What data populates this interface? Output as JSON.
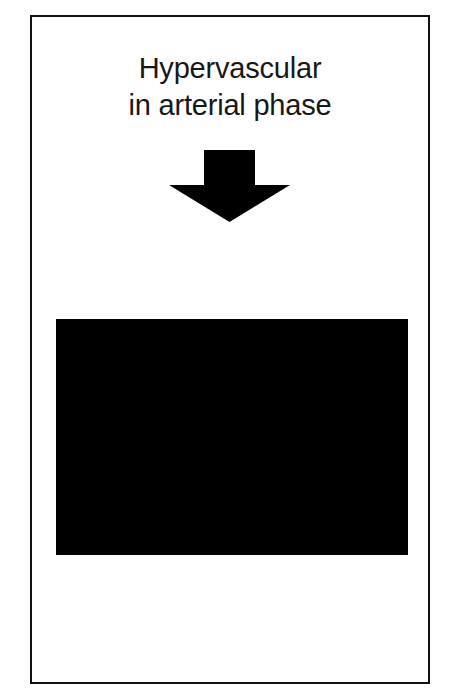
{
  "slide": {
    "background_color": "#ffffff",
    "border_color": "#111111",
    "caption": {
      "line1": "Hypervascular",
      "line2": "in arterial phase",
      "color": "#171717"
    },
    "arrow": {
      "icon": "arrow-down-block-icon",
      "direction": "down",
      "color": "#000000"
    },
    "figure": {
      "modality": "CT",
      "plane": "axial",
      "region": "upper abdomen",
      "background_color": "#000000",
      "description": "Axial contrast-enhanced abdominal CT in arterial phase showing a hypervascular mass in the right hepatic lobe, with gastric gas bubble, aorta, spine and kidneys visible.",
      "structures": [
        "liver",
        "hypervascular hepatic lesion",
        "stomach gas bubble",
        "spleen",
        "aorta",
        "vertebral body",
        "spinal canal",
        "left kidney",
        "right kidney",
        "abdominal wall musculature",
        "subcutaneous fat"
      ]
    }
  }
}
